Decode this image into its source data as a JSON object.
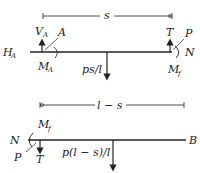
{
  "diagram": {
    "type": "free-body diagram of beam segments",
    "top_segment": {
      "dimension_label": "s",
      "left_support": {
        "horizontal_reaction": {
          "base": "H",
          "sub": "A"
        },
        "vertical_reaction": {
          "base": "V",
          "sub": "A"
        },
        "moment": {
          "base": "M",
          "sub": "A"
        },
        "point_label": "A"
      },
      "distributed_load_resultant": "ps/l",
      "right_end": {
        "tension": "T",
        "axial": "N",
        "force": "P",
        "moment": {
          "base": "M",
          "sub": "f"
        }
      }
    },
    "bottom_segment": {
      "dimension_label": "l − s",
      "left_end": {
        "axial": "N",
        "force": "P",
        "tension": "T",
        "moment": {
          "base": "M",
          "sub": "f"
        }
      },
      "distributed_load_resultant": "p(l − s)/l",
      "right_end_label": "B"
    },
    "colors": {
      "ink": "#222222",
      "background": "#ffffff"
    }
  }
}
